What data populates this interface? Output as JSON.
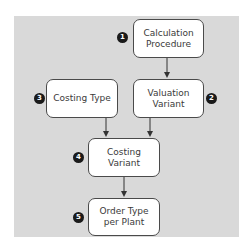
{
  "diagram": {
    "type": "flowchart",
    "colors": {
      "background": "#ffffff",
      "panel": "#d9d9d9",
      "box_fill": "#ffffff",
      "box_border": "#4a4a4a",
      "badge_fill": "#1a1a1a",
      "badge_text": "#ffffff",
      "arrow": "#333333"
    },
    "nodes": [
      {
        "id": "calculation-procedure",
        "number": "1",
        "label": "Calculation\nProcedure"
      },
      {
        "id": "valuation-variant",
        "number": "2",
        "label": "Valuation\nVariant"
      },
      {
        "id": "costing-type",
        "number": "3",
        "label": "Costing Type"
      },
      {
        "id": "costing-variant",
        "number": "4",
        "label": "Costing\nVariant"
      },
      {
        "id": "order-type-per-plant",
        "number": "5",
        "label": "Order Type\nper Plant"
      }
    ],
    "edges": [
      {
        "from": "calculation-procedure",
        "to": "valuation-variant"
      },
      {
        "from": "costing-type",
        "to": "costing-variant"
      },
      {
        "from": "valuation-variant",
        "to": "costing-variant"
      },
      {
        "from": "costing-variant",
        "to": "order-type-per-plant"
      }
    ]
  }
}
